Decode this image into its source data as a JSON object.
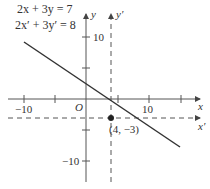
{
  "equations": {
    "original": "2x + 3y = 7",
    "transformed": "2x′ + 3y′ = 8"
  },
  "axes": {
    "x_label": "x",
    "y_label": "y",
    "x_prime_label": "x′",
    "y_prime_label": "y′",
    "origin_label": "O",
    "tick_labels": {
      "x_neg10": "−10",
      "x_10": "10",
      "y_10": "10",
      "y_neg10": "−10"
    }
  },
  "point": {
    "label": "(4, −3)",
    "x": 4,
    "y": -3
  },
  "colors": {
    "line": "#333333",
    "axis": "#555555",
    "dashed_axis": "#555555"
  }
}
